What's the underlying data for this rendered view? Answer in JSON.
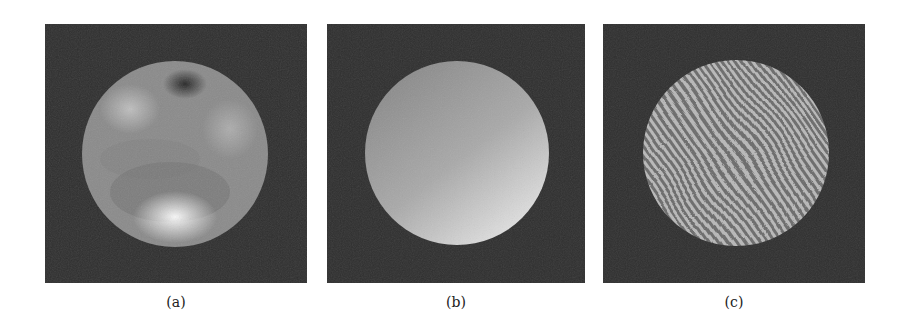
{
  "figure": {
    "panels": [
      {
        "id": "a",
        "label": "(a)",
        "description": "Disk with irregular smooth intensity blobs (bright spot at bottom, dark spot at top)"
      },
      {
        "id": "b",
        "label": "(b)",
        "description": "Disk with smooth linear intensity gradient, brighter toward bottom-right"
      },
      {
        "id": "c",
        "label": "(c)",
        "description": "Disk with dense curved fringe pattern (interferogram)"
      }
    ],
    "colors": {
      "background": "#2e2e2e",
      "page": "#ffffff"
    }
  }
}
